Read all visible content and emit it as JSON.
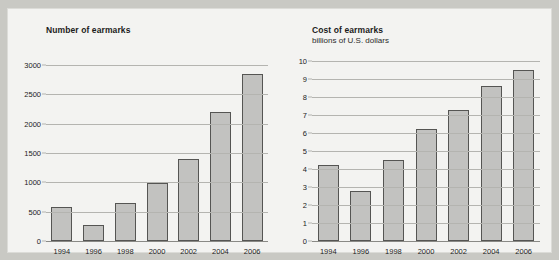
{
  "page": {
    "background_color": "#c9c9c4",
    "panel_color": "#f3f3f1"
  },
  "colors": {
    "bar_fill": "#c2c2c0",
    "bar_border": "#555553",
    "gridline": "#b4b4b0",
    "axis": "#8a8a86",
    "text": "#1c1c1c"
  },
  "charts": {
    "left": {
      "title": "Number of earmarks",
      "subtitle": ""
    },
    "right": {
      "title": "Cost of earmarks",
      "subtitle": "billions of U.S. dollars"
    }
  },
  "chart_data": [
    {
      "type": "bar",
      "title": "Number of earmarks",
      "subtitle": "",
      "xlabel": "",
      "ylabel": "",
      "categories": [
        "1994",
        "1996",
        "1998",
        "2000",
        "2002",
        "2004",
        "2006"
      ],
      "values": [
        580,
        280,
        640,
        990,
        1400,
        2200,
        2850
      ],
      "ylim": [
        0,
        3000
      ],
      "yticks": [
        0,
        500,
        1000,
        1500,
        2000,
        2500,
        3000
      ],
      "ytick_labels": [
        "0",
        "500",
        "1000",
        "1500",
        "2000",
        "2500",
        "3000"
      ],
      "grid": true,
      "legend": "none"
    },
    {
      "type": "bar",
      "title": "Cost of earmarks",
      "subtitle": "billions of U.S. dollars",
      "xlabel": "",
      "ylabel": "billions of U.S. dollars",
      "categories": [
        "1994",
        "1996",
        "1998",
        "2000",
        "2002",
        "2004",
        "2006"
      ],
      "values": [
        4.2,
        2.8,
        4.5,
        6.2,
        7.3,
        8.6,
        9.5
      ],
      "ylim": [
        0,
        10
      ],
      "yticks": [
        0,
        1,
        2,
        3,
        4,
        5,
        6,
        7,
        8,
        9,
        10
      ],
      "ytick_labels": [
        "0",
        "1",
        "2",
        "3",
        "4",
        "5",
        "6",
        "7",
        "8",
        "9",
        "10"
      ],
      "grid": true,
      "legend": "none"
    }
  ]
}
